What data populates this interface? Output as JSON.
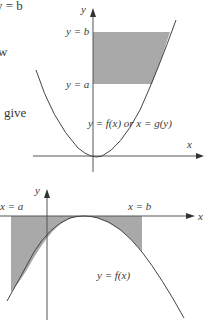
{
  "margin_text": {
    "top": "y = b",
    "middle": "w",
    "lower": "give"
  },
  "top_figure": {
    "axis_x_label": "x",
    "axis_y_label": "y",
    "bound_upper_label": "y = b",
    "bound_lower_label": "y = a",
    "curve_label": "y = f(x) or x = g(y)",
    "shade_color": "#9a9a9a",
    "curve_color": "#444444"
  },
  "bottom_figure": {
    "axis_x_label": "x",
    "axis_y_label": "y",
    "bound_left_label": "x = a",
    "bound_right_label": "x = b",
    "curve_label": "y = f(x)",
    "shade_color": "#9a9a9a",
    "curve_color": "#444444"
  }
}
